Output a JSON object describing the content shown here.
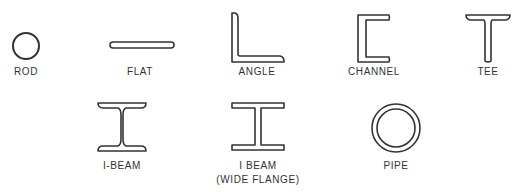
{
  "shapes": {
    "rod": {
      "label": "ROD"
    },
    "flat": {
      "label": "FLAT"
    },
    "angle": {
      "label": "ANGLE"
    },
    "channel": {
      "label": "CHANNEL"
    },
    "tee": {
      "label": "TEE"
    },
    "ibeam": {
      "label": "I-BEAM"
    },
    "wideflange": {
      "label_line1": "I BEAM",
      "label_line2": "(WIDE FLANGE)"
    },
    "pipe": {
      "label": "PIPE"
    }
  },
  "colors": {
    "stroke": "#333333",
    "background": "#ffffff"
  }
}
